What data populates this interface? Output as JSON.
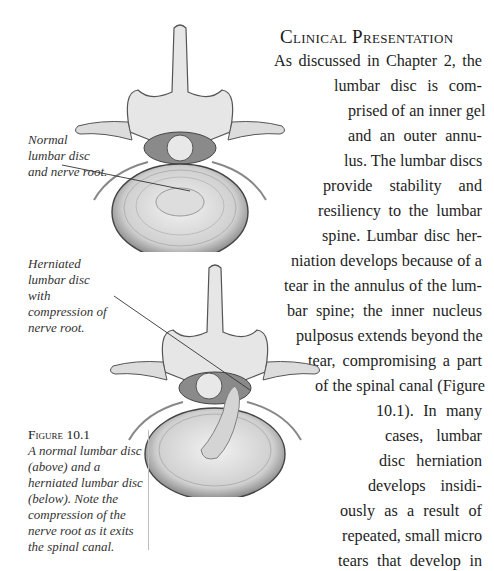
{
  "section_heading": "Clinical Presentation",
  "body_lines": [
    {
      "text": "As discussed in Chapter 2, the",
      "left": 274,
      "top": 52
    },
    {
      "text": "lumbar disc is com-",
      "left": 334,
      "top": 77
    },
    {
      "text": "prised of an inner gel",
      "left": 348,
      "top": 102
    },
    {
      "text": "and an outer annu-",
      "left": 348,
      "top": 127
    },
    {
      "text": "lus. The lumbar discs",
      "left": 344,
      "top": 152
    },
    {
      "text": "provide stability and",
      "left": 323,
      "top": 177
    },
    {
      "text": "resiliency to the lumbar",
      "left": 318,
      "top": 202
    },
    {
      "text": "spine. Lumbar disc her-",
      "left": 322,
      "top": 227
    },
    {
      "text": "niation develops because of a",
      "left": 291,
      "top": 252
    },
    {
      "text": "tear in the annulus of the lum-",
      "left": 284,
      "top": 277
    },
    {
      "text": "bar spine;  the inner nucleus",
      "left": 287,
      "top": 302
    },
    {
      "text": "pulposus extends beyond the",
      "left": 296,
      "top": 327
    },
    {
      "text": "tear, compromising a part",
      "left": 308,
      "top": 352
    },
    {
      "text": "of the spinal canal (Figure",
      "left": 315,
      "top": 377
    },
    {
      "text": "10.1). In many",
      "left": 376,
      "top": 402
    },
    {
      "text": "cases, lumbar",
      "left": 385,
      "top": 427
    },
    {
      "text": "disc herniation",
      "left": 379,
      "top": 452
    },
    {
      "text": "develops insidi-",
      "left": 368,
      "top": 477
    },
    {
      "text": "ously as a result of",
      "left": 340,
      "top": 502
    },
    {
      "text": "repeated, small micro",
      "left": 342,
      "top": 527
    },
    {
      "text": "tears that develop in",
      "left": 338,
      "top": 552
    },
    {
      "text": "conjunction with a",
      "left": 328,
      "top": 577
    },
    {
      "text": "degenerative disc. In",
      "left": 322,
      "top": 602
    },
    {
      "text": "these cases, patients with",
      "left": 322,
      "top": 627
    },
    {
      "text": "lumbar disc herniation may be",
      "left": 288,
      "top": 652
    },
    {
      "text": "completely without symptoms. Indeed, modern",
      "left": 152,
      "top": 677
    }
  ],
  "figure": {
    "label_normal": "Normal lumbar disc and nerve root.",
    "label_herniated": "Herniated lumbar disc with compression of nerve root.",
    "caption_title": "Figure 10.1",
    "caption_text": "A normal lumbar disc (above) and a herniated lumbar disc (below).  Note the compression of the nerve root as it exits the spinal canal."
  }
}
